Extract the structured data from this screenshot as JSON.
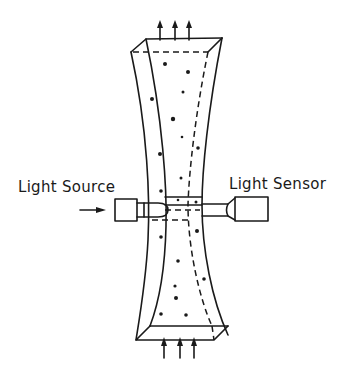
{
  "diagram": {
    "labels": {
      "light_source": "Light Source",
      "light_sensor": "Light Sensor"
    },
    "components": [
      {
        "name": "specimen",
        "shape": "hourglass-prism"
      },
      {
        "name": "light-source",
        "shape": "box-with-tube"
      },
      {
        "name": "light-sensor",
        "shape": "box-with-tube"
      },
      {
        "name": "top-load-arrows",
        "count": 3,
        "direction": "up"
      },
      {
        "name": "bottom-load-arrows",
        "count": 3,
        "direction": "up"
      },
      {
        "name": "input-arrow",
        "direction": "right"
      }
    ],
    "colors": {
      "line": "#1a1a1a",
      "background": "#ffffff"
    }
  }
}
